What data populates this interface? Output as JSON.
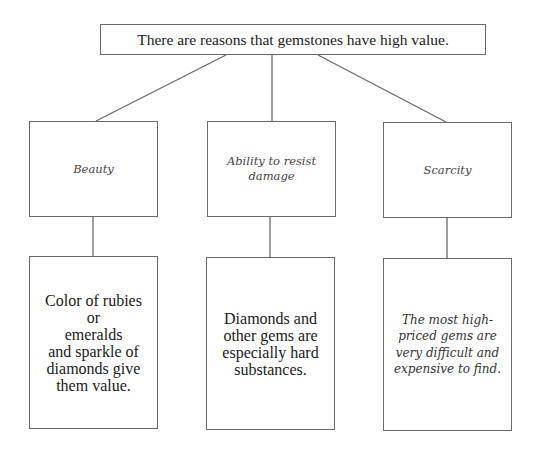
{
  "diagram": {
    "type": "tree",
    "root": {
      "label": "There are reasons that gemstones have high value."
    },
    "branches": [
      {
        "category": "Beauty",
        "detail": "Color of rubies or\nemeralds\nand sparkle of\ndiamonds give\nthem value.",
        "detail_style": "regular"
      },
      {
        "category": "Ability to resist\ndamage",
        "detail": "Diamonds and\nother gems are\nespecially hard\nsubstances.",
        "detail_style": "regular"
      },
      {
        "category": "Scarcity",
        "detail": "The most high-\npriced gems are\nvery difficult and\nexpensive to find.",
        "detail_style": "italic"
      }
    ],
    "colors": {
      "line": "#6a6a6a",
      "text": "#1a1a1a",
      "italic_text": "#444444",
      "background": "#ffffff"
    }
  }
}
